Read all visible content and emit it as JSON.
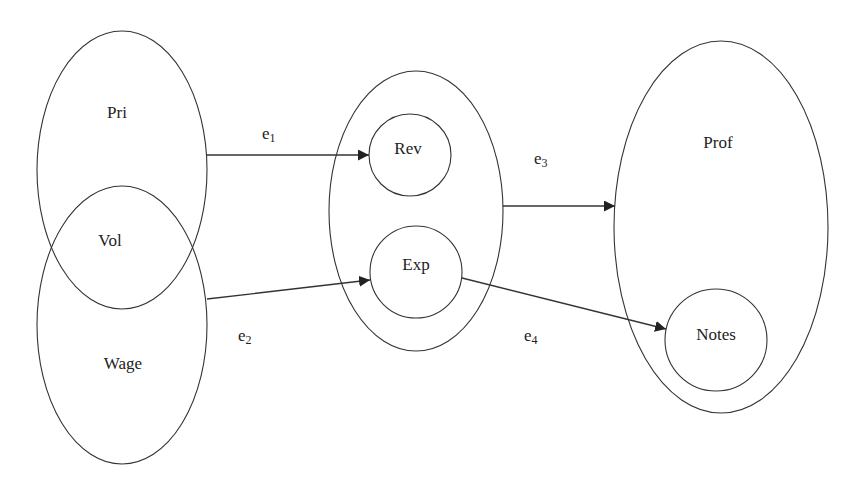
{
  "diagram": {
    "nodes": {
      "pri": {
        "label": "Pri"
      },
      "vol": {
        "label": "Vol"
      },
      "wage": {
        "label": "Wage"
      },
      "rev": {
        "label": "Rev"
      },
      "exp": {
        "label": "Exp"
      },
      "prof": {
        "label": "Prof"
      },
      "notes": {
        "label": "Notes"
      }
    },
    "edges": [
      {
        "name": "e",
        "sub": "1",
        "from": "Pri",
        "to": "Rev"
      },
      {
        "name": "e",
        "sub": "2",
        "from": "Wage",
        "to": "Exp"
      },
      {
        "name": "e",
        "sub": "3",
        "from": "Rev/Exp group",
        "to": "Prof"
      },
      {
        "name": "e",
        "sub": "4",
        "from": "Exp",
        "to": "Notes"
      }
    ],
    "colors": {
      "stroke": "#333333",
      "background": "#ffffff"
    }
  }
}
